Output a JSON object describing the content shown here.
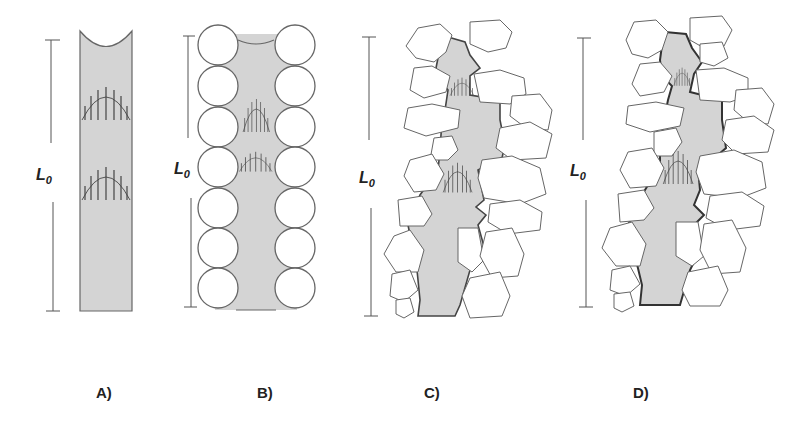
{
  "figure": {
    "fill_color": "#d3d3d3",
    "outline_color": "#555555",
    "panels": [
      {
        "id": "A",
        "label": "A)",
        "length_label": "L",
        "length_sub": "0",
        "type": "straight-tube"
      },
      {
        "id": "B",
        "label": "B)",
        "length_label": "L",
        "length_sub": "0",
        "type": "packed-spheres"
      },
      {
        "id": "C",
        "label": "C)",
        "length_label": "L",
        "length_sub": "0",
        "type": "irregular-grains"
      },
      {
        "id": "D",
        "label": "D)",
        "length_label": "L",
        "length_sub": "0",
        "type": "irregular-grains-rough"
      }
    ]
  }
}
